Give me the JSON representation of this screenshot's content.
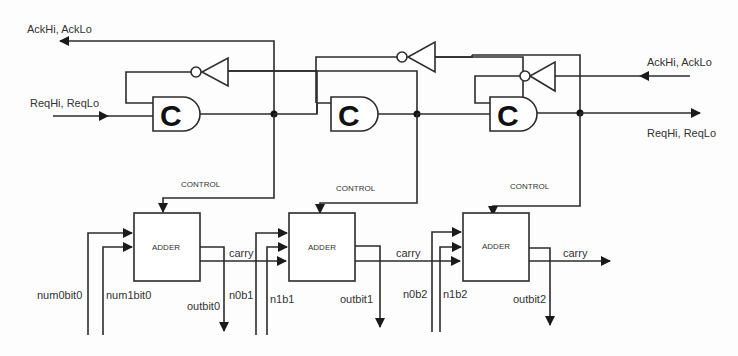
{
  "diagram": {
    "type": "asynchronous ripple-carry adder pipeline",
    "signals": {
      "ack_left": "AckHi, AckLo",
      "req_left": "ReqHi, ReqLo",
      "ack_right": "AckHi, AckLo",
      "req_right": "ReqHi, ReqLo"
    },
    "c_element_label": "C",
    "stages": [
      {
        "c_element": "C",
        "control_label": "CONTROL",
        "adder_label": "ADDER",
        "input_a": "num0bit0",
        "input_b": "num1bit0",
        "carry_out": "carry",
        "output": "outbit0"
      },
      {
        "c_element": "C",
        "control_label": "CONTROL",
        "adder_label": "ADDER",
        "input_a": "n0b1",
        "input_b": "n1b1",
        "carry_out": "carry",
        "output": "outbit1"
      },
      {
        "c_element": "C",
        "control_label": "CONTROL",
        "adder_label": "ADDER",
        "input_a": "n0b2",
        "input_b": "n1b2",
        "carry_out": "carry",
        "output": "outbit2"
      }
    ]
  }
}
